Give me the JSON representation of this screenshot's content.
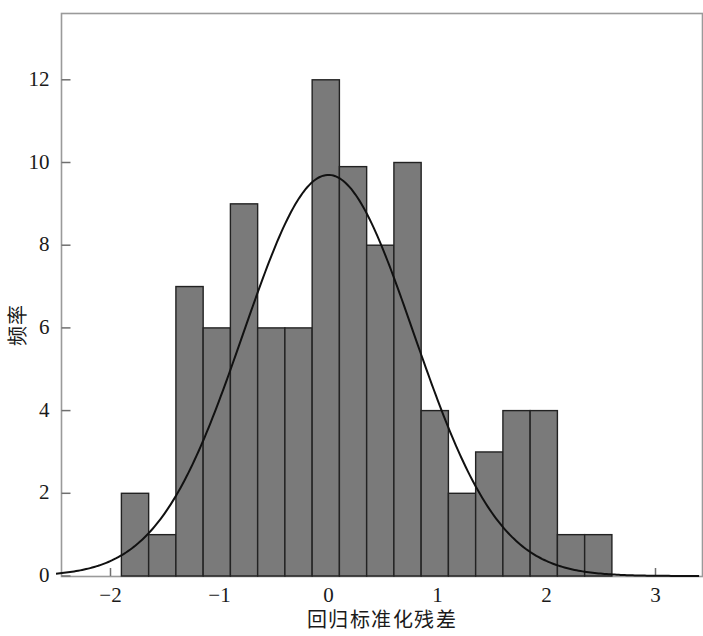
{
  "chart_data": {
    "type": "bar",
    "title": "",
    "subtitle": "",
    "xlabel": "回归标准化残差",
    "ylabel": "频率",
    "xlim": [
      -2.5,
      3.4
    ],
    "ylim": [
      0,
      13.2
    ],
    "grid": false,
    "legend": null,
    "bin_width": 0.25,
    "bin_edges": [
      -1.9,
      -1.65,
      -1.4,
      -1.15,
      -0.9,
      -0.65,
      -0.4,
      -0.15,
      0.1,
      0.35,
      0.6,
      0.85,
      1.1,
      1.35,
      1.6,
      1.85,
      2.1,
      2.35,
      2.6
    ],
    "categories": [
      "-1.90 to -1.65",
      "-1.65 to -1.40",
      "-1.40 to -1.15",
      "-1.15 to -0.90",
      "-0.90 to -0.65",
      "-0.65 to -0.40",
      "-0.40 to -0.15",
      "-0.15 to 0.10",
      "0.10 to 0.35",
      "0.35 to 0.60",
      "0.60 to 0.85",
      "0.85 to 1.10",
      "1.10 to 1.35",
      "1.35 to 1.60",
      "1.60 to 1.85",
      "1.85 to 2.10",
      "2.10 to 2.35",
      "2.35 to 2.60"
    ],
    "values": [
      2,
      1,
      7,
      6,
      9,
      6,
      6,
      12,
      9.9,
      8,
      10,
      4,
      2,
      3,
      4,
      4,
      1,
      1
    ],
    "x_ticks": [
      -2,
      -1,
      0,
      1,
      2,
      3
    ],
    "x_tick_labels": [
      "-2",
      "-1",
      "0",
      "1",
      "2",
      "3"
    ],
    "y_ticks": [
      0,
      2,
      4,
      6,
      8,
      10,
      12
    ],
    "y_tick_labels": [
      "0",
      "2",
      "4",
      "6",
      "8",
      "10",
      "12"
    ],
    "overlay_curve": {
      "name": "normal",
      "mean": 0,
      "sigma": 0.78,
      "peak_value": 9.7
    },
    "bar_fill_color": "#7a7a7a",
    "bar_edge_color": "#222222",
    "curve_color": "#111111",
    "frame_color": "#9a9a9a",
    "background_color": "#ffffff"
  },
  "axes": {
    "y_title": "频率",
    "x_title": "回归标准化残差"
  }
}
